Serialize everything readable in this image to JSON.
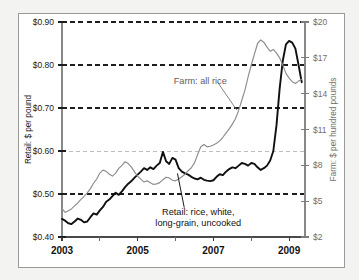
{
  "chart_data": {
    "type": "line",
    "title": "",
    "xlabel": "",
    "ylabel": "Retail: $ per pound",
    "y2label": "Farm: $ per hundred pounds",
    "grid": true,
    "grid_values": [
      0.9,
      0.8,
      0.7,
      0.6,
      0.5
    ],
    "legend_position": "annotations-inline",
    "xlim": [
      2003.0,
      2009.42
    ],
    "ylim": [
      0.4,
      0.9
    ],
    "y2lim": [
      2,
      20
    ],
    "yticks": [
      0.4,
      0.5,
      0.6,
      0.7,
      0.8,
      0.9
    ],
    "ytick_labels": [
      "$0.40",
      "$0.50",
      "$0.60",
      "$0.70",
      "$0.80",
      "$0.90"
    ],
    "y2ticks": [
      2,
      5,
      8,
      11,
      14,
      17,
      20
    ],
    "y2tick_labels": [
      "$2",
      "$5",
      "$8",
      "$11",
      "$14",
      "$17",
      "$20"
    ],
    "xticks_major": [
      2003,
      2005,
      2007,
      2009
    ],
    "xtick_major_labels": [
      "2003",
      "2005",
      "2007",
      "2009"
    ],
    "xticks_minor": [
      2004,
      2006,
      2008
    ],
    "annotations": [
      {
        "name": "farm-series-annotation",
        "lines": [
          "Farm: all rice"
        ],
        "x": 2005.95,
        "y": 0.755,
        "color": "#5d5d5d",
        "leader_to": [
          2007.62,
          0.695
        ]
      },
      {
        "name": "retail-series-annotation",
        "lines": [
          "Retail: rice, white,",
          "long-grain, uncooked"
        ],
        "x": 2006.6,
        "y": 0.452,
        "color": "#111111",
        "leader_to": [
          2006.05,
          0.548
        ]
      }
    ],
    "series": [
      {
        "name": "Retail: rice, white, long-grain, uncooked",
        "axis": "left",
        "units": "$ per pound",
        "color": "#101010",
        "style": "solid-bold",
        "x": [
          2003.0,
          2003.083,
          2003.167,
          2003.25,
          2003.333,
          2003.417,
          2003.5,
          2003.583,
          2003.667,
          2003.75,
          2003.833,
          2003.917,
          2004.0,
          2004.083,
          2004.167,
          2004.25,
          2004.333,
          2004.417,
          2004.5,
          2004.583,
          2004.667,
          2004.75,
          2004.833,
          2004.917,
          2005.0,
          2005.083,
          2005.167,
          2005.25,
          2005.333,
          2005.417,
          2005.5,
          2005.583,
          2005.667,
          2005.75,
          2005.833,
          2005.917,
          2006.0,
          2006.083,
          2006.167,
          2006.25,
          2006.333,
          2006.417,
          2006.5,
          2006.583,
          2006.667,
          2006.75,
          2006.833,
          2006.917,
          2007.0,
          2007.083,
          2007.167,
          2007.25,
          2007.333,
          2007.417,
          2007.5,
          2007.583,
          2007.667,
          2007.75,
          2007.833,
          2007.917,
          2008.0,
          2008.083,
          2008.167,
          2008.25,
          2008.333,
          2008.417,
          2008.5,
          2008.583,
          2008.667,
          2008.75,
          2008.833,
          2008.917,
          2009.0,
          2009.083,
          2009.167,
          2009.25,
          2009.333
        ],
        "values": [
          0.442,
          0.438,
          0.432,
          0.43,
          0.436,
          0.443,
          0.44,
          0.434,
          0.436,
          0.446,
          0.455,
          0.452,
          0.462,
          0.47,
          0.482,
          0.487,
          0.495,
          0.503,
          0.498,
          0.506,
          0.516,
          0.524,
          0.53,
          0.538,
          0.545,
          0.552,
          0.56,
          0.556,
          0.562,
          0.558,
          0.566,
          0.572,
          0.598,
          0.576,
          0.57,
          0.584,
          0.58,
          0.56,
          0.552,
          0.548,
          0.545,
          0.54,
          0.536,
          0.534,
          0.538,
          0.533,
          0.531,
          0.53,
          0.532,
          0.54,
          0.546,
          0.544,
          0.552,
          0.558,
          0.562,
          0.56,
          0.566,
          0.572,
          0.57,
          0.566,
          0.572,
          0.57,
          0.562,
          0.556,
          0.56,
          0.566,
          0.578,
          0.6,
          0.66,
          0.745,
          0.81,
          0.848,
          0.856,
          0.852,
          0.838,
          0.8,
          0.76
        ]
      },
      {
        "name": "Farm: all rice",
        "axis": "right",
        "units": "$ per hundred pounds",
        "color": "#8d8d8d",
        "style": "solid-thin",
        "x": [
          2003.0,
          2003.083,
          2003.167,
          2003.25,
          2003.333,
          2003.417,
          2003.5,
          2003.583,
          2003.667,
          2003.75,
          2003.833,
          2003.917,
          2004.0,
          2004.083,
          2004.167,
          2004.25,
          2004.333,
          2004.417,
          2004.5,
          2004.583,
          2004.667,
          2004.75,
          2004.833,
          2004.917,
          2005.0,
          2005.083,
          2005.167,
          2005.25,
          2005.333,
          2005.417,
          2005.5,
          2005.583,
          2005.667,
          2005.75,
          2005.833,
          2005.917,
          2006.0,
          2006.083,
          2006.167,
          2006.25,
          2006.333,
          2006.417,
          2006.5,
          2006.583,
          2006.667,
          2006.75,
          2006.833,
          2006.917,
          2007.0,
          2007.083,
          2007.167,
          2007.25,
          2007.333,
          2007.417,
          2007.5,
          2007.583,
          2007.667,
          2007.75,
          2007.833,
          2007.917,
          2008.0,
          2008.083,
          2008.167,
          2008.25,
          2008.333,
          2008.417,
          2008.5,
          2008.583,
          2008.667,
          2008.75,
          2008.833,
          2008.917,
          2009.0,
          2009.083,
          2009.167,
          2009.25,
          2009.333
        ],
        "values": [
          4.4,
          4.05,
          4.2,
          4.35,
          4.6,
          4.85,
          5.15,
          5.4,
          5.7,
          6.05,
          6.5,
          6.85,
          7.35,
          7.6,
          7.5,
          7.25,
          7.1,
          7.35,
          7.75,
          8.0,
          8.3,
          8.15,
          7.85,
          7.45,
          7.1,
          6.85,
          6.6,
          6.7,
          6.55,
          6.4,
          6.45,
          6.55,
          6.8,
          7.0,
          6.95,
          6.75,
          6.7,
          6.85,
          7.05,
          7.25,
          7.55,
          7.8,
          8.2,
          8.9,
          9.55,
          9.75,
          9.55,
          9.6,
          9.7,
          9.85,
          10.05,
          10.35,
          10.7,
          11.05,
          11.45,
          11.9,
          12.6,
          13.45,
          14.3,
          15.4,
          16.4,
          17.3,
          18.2,
          18.5,
          18.3,
          17.9,
          17.55,
          17.7,
          17.4,
          17.0,
          16.4,
          15.7,
          15.3,
          15.0,
          14.85,
          15.05,
          15.2
        ]
      }
    ]
  }
}
